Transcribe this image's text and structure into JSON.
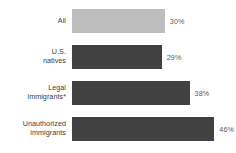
{
  "chart_data": {
    "type": "bar",
    "orientation": "horizontal",
    "title": "",
    "subtitle": "",
    "xlabel": "",
    "ylabel": "",
    "grid": false,
    "legend": "none",
    "xlim": [
      0,
      53
    ],
    "categories": [
      "All",
      "U.S.\nnatives",
      "Legal\nimmigrants*",
      "Unauthorized\nimmigrants"
    ],
    "values": [
      30,
      29,
      38,
      46
    ],
    "value_labels": [
      "30%",
      "29%",
      "38%",
      "46%"
    ],
    "colors": [
      "#bdbdbd",
      "#414141",
      "#414141",
      "#414141"
    ]
  },
  "bars": [
    {
      "label": "All",
      "value_label": "30%",
      "value": 30,
      "color": "#bdbdbd"
    },
    {
      "label": "U.S.\nnatives",
      "value_label": "29%",
      "value": 29,
      "color": "#414141"
    },
    {
      "label": "Legal\nimmigrants*",
      "value_label": "38%",
      "value": 38,
      "color": "#414141"
    },
    {
      "label": "Unauthorized\nimmigrants",
      "value_label": "46%",
      "value": 46,
      "color": "#414141"
    }
  ]
}
